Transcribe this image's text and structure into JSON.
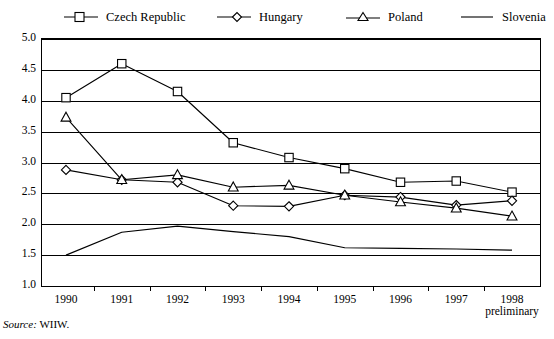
{
  "chart_data": {
    "type": "line",
    "title": "",
    "subtitle": "",
    "xlabel": "",
    "ylabel": "",
    "x": [
      1990,
      1991,
      1992,
      1993,
      1994,
      1995,
      1996,
      1997,
      1998
    ],
    "categories": [
      "1990",
      "1991",
      "1992",
      "1993",
      "1994",
      "1995",
      "1996",
      "1997",
      "1998"
    ],
    "xtick_sublabels": [
      "",
      "",
      "",
      "",
      "",
      "",
      "",
      "",
      "preliminary"
    ],
    "ylim": [
      1.0,
      5.0
    ],
    "yticks": [
      "5.0",
      "4.5",
      "4.0",
      "3.5",
      "3.0",
      "2.5",
      "2.0",
      "1.5",
      "1.0"
    ],
    "ytick_values": [
      5.0,
      4.5,
      4.0,
      3.5,
      3.0,
      2.5,
      2.0,
      1.5,
      1.0
    ],
    "grid": "horizontal",
    "legend_position": "top",
    "series": [
      {
        "name": "Czech Republic",
        "marker": "square",
        "values": [
          4.05,
          4.6,
          4.15,
          3.32,
          3.08,
          2.9,
          2.68,
          2.7,
          2.52
        ]
      },
      {
        "name": "Hungary",
        "marker": "diamond",
        "values": [
          2.88,
          2.72,
          2.68,
          2.3,
          2.29,
          2.47,
          2.44,
          2.31,
          2.38
        ]
      },
      {
        "name": "Poland",
        "marker": "triangle",
        "values": [
          3.73,
          2.72,
          2.8,
          2.6,
          2.63,
          2.47,
          2.36,
          2.26,
          2.13
        ]
      },
      {
        "name": "Slovenia",
        "marker": "none",
        "values": [
          1.5,
          1.87,
          1.97,
          1.88,
          1.8,
          1.62,
          1.61,
          1.6,
          1.58
        ]
      }
    ],
    "annotations": []
  },
  "legend": {
    "items": [
      {
        "label": "Czech Republic",
        "marker": "square"
      },
      {
        "label": "Hungary",
        "marker": "diamond"
      },
      {
        "label": "Poland",
        "marker": "triangle"
      },
      {
        "label": "Slovenia",
        "marker": "none"
      }
    ]
  },
  "footer": {
    "source_label": "Source:",
    "source_value": "WIIW."
  },
  "colors": {
    "line": "#000000",
    "grid": "#000000",
    "background": "#ffffff"
  }
}
